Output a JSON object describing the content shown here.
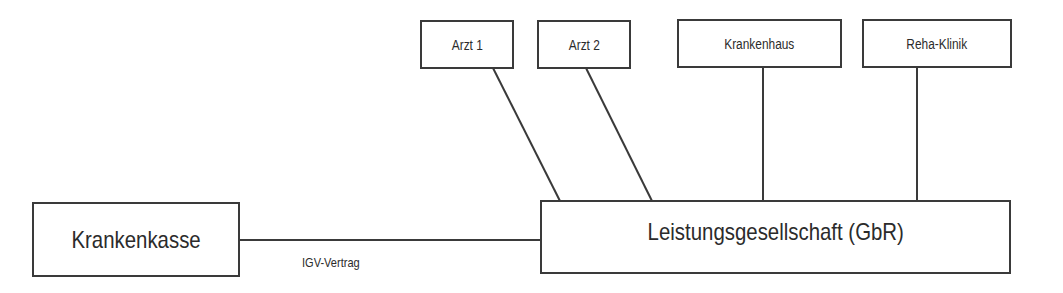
{
  "diagram": {
    "nodes": {
      "arzt1": {
        "label": "Arzt 1"
      },
      "arzt2": {
        "label": "Arzt 2"
      },
      "krankenhaus": {
        "label": "Krankenhaus"
      },
      "reha": {
        "label": "Reha-Klinik"
      },
      "krankenkasse": {
        "label": "Krankenkasse"
      },
      "gbr": {
        "label": "Leistungsgesellschaft (GbR)"
      }
    },
    "edges": [
      {
        "from": "krankenkasse",
        "to": "gbr",
        "label": "IGV-Vertrag"
      },
      {
        "from": "arzt1",
        "to": "gbr"
      },
      {
        "from": "arzt2",
        "to": "gbr"
      },
      {
        "from": "krankenhaus",
        "to": "gbr"
      },
      {
        "from": "reha",
        "to": "gbr"
      }
    ],
    "line_color": "#3a3a3a"
  }
}
